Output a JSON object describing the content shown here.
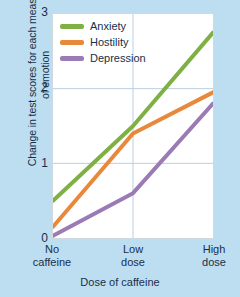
{
  "chart_data": {
    "type": "line",
    "title": "",
    "xlabel": "Dose of caffeine",
    "ylabel": "Change in test scores for each measure of emotion",
    "categories": [
      "No caffeine",
      "Low dose",
      "High dose"
    ],
    "xtick_lines": [
      [
        "No",
        "caffeine"
      ],
      [
        "Low",
        "dose"
      ],
      [
        "High",
        "dose"
      ]
    ],
    "ylim": [
      0,
      3
    ],
    "yticks": [
      "0",
      "1",
      "2",
      "3"
    ],
    "ytick_values": [
      0,
      1,
      2,
      3
    ],
    "grid": "both",
    "legend_position": "top-left",
    "background_color": "#bdddf0",
    "plot_background_color": "#ffffff",
    "grid_color": "#b9cfe0",
    "text_color": "#17304a",
    "series": [
      {
        "name": "Anxiety",
        "color": "#7fb043",
        "values": [
          0.5,
          1.5,
          2.75
        ]
      },
      {
        "name": "Hostility",
        "color": "#e8883a",
        "values": [
          0.15,
          1.4,
          1.95
        ]
      },
      {
        "name": "Depression",
        "color": "#9b7bb5",
        "values": [
          0.03,
          0.6,
          1.8
        ]
      }
    ]
  },
  "legend": {
    "items": [
      {
        "label": "Anxiety"
      },
      {
        "label": "Hostility"
      },
      {
        "label": "Depression"
      }
    ]
  }
}
